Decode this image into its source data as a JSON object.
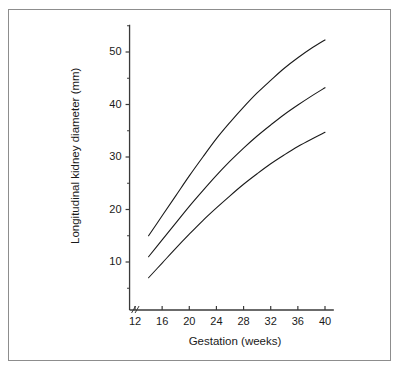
{
  "chart_data": {
    "type": "line",
    "title": "",
    "xlabel": "Gestation (weeks)",
    "ylabel": "Longitudinal kidney diameter (mm)",
    "xlim": [
      11.2,
      41.5
    ],
    "ylim": [
      0,
      55
    ],
    "grid": false,
    "legend": "none",
    "axis_break": "x-axis break near origin",
    "xticks": [
      12,
      16,
      20,
      24,
      28,
      32,
      36,
      40
    ],
    "xtick_labels": [
      "12",
      "16",
      "20",
      "24",
      "28",
      "32",
      "36",
      "40"
    ],
    "yticks": [
      10,
      20,
      30,
      40,
      50
    ],
    "ytick_labels": [
      "10",
      "20",
      "30",
      "40",
      "50"
    ],
    "y_minor_ticks": [
      5,
      15,
      25,
      35,
      45,
      55
    ],
    "x": [
      14,
      16,
      18,
      20,
      22,
      24,
      26,
      28,
      30,
      32,
      34,
      36,
      38,
      40
    ],
    "series": [
      {
        "name": "upper centile",
        "values": [
          15.0,
          18.8,
          22.6,
          26.4,
          30.0,
          33.5,
          36.6,
          39.5,
          42.2,
          44.6,
          46.9,
          48.9,
          50.7,
          52.3
        ]
      },
      {
        "name": "median",
        "values": [
          11.0,
          14.2,
          17.4,
          20.6,
          23.6,
          26.5,
          29.2,
          31.7,
          34.0,
          36.1,
          38.1,
          39.9,
          41.6,
          43.2
        ]
      },
      {
        "name": "lower centile",
        "values": [
          7.0,
          9.8,
          12.6,
          15.3,
          17.9,
          20.3,
          22.6,
          24.8,
          26.8,
          28.7,
          30.4,
          32.0,
          33.4,
          34.7
        ]
      }
    ]
  },
  "style": {
    "line_color": "#1a1a1a",
    "axis_color": "#3a3a3a",
    "frame_color": "#8d8d8d",
    "background": "#ffffff"
  }
}
